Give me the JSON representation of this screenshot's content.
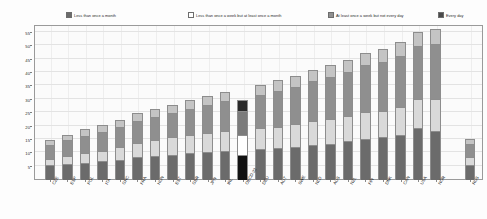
{
  "chart_data": {
    "type": "bar",
    "subtype": "stacked-vertical",
    "title": "",
    "xlabel": "",
    "ylabel": "",
    "ylim": [
      0,
      58
    ],
    "y_ticks": [
      5,
      10,
      15,
      20,
      25,
      30,
      35,
      40,
      45,
      50,
      55
    ],
    "grid": true,
    "legend_position": "top",
    "stack_order_bottom_to_top": [
      "Every day",
      "At least once a week but not every day",
      "Less than once a week but at least once a month",
      "Less than once a month"
    ],
    "categories": [
      "CZE",
      "ESP",
      "POL",
      "ITA",
      "GRC",
      "FRA",
      "HUN",
      "EST",
      "GBR",
      "JPN",
      "IRL",
      "OECD-22",
      "DEU",
      "AUT",
      "SWE",
      "NLD",
      "AUS",
      "NZL",
      "FIN",
      "DNK",
      "CAN",
      "USA",
      "NOR",
      "RUS"
    ],
    "highlight_category": "OECD-22",
    "separated_category": "RUS",
    "series": [
      {
        "name": "Less than once a month",
        "color": "#c4c4c4",
        "values": [
          2.0,
          2.0,
          2.5,
          2.5,
          2.5,
          3.0,
          3.0,
          3.0,
          3.5,
          3.5,
          3.5,
          4.0,
          3.5,
          4.0,
          4.0,
          4.0,
          4.5,
          4.5,
          4.5,
          5.0,
          5.0,
          5.5,
          5.5,
          2.0
        ]
      },
      {
        "name": "At least once a week but not every day",
        "color": "#8f8f8f",
        "values": [
          5.0,
          6.0,
          6.5,
          7.0,
          7.5,
          8.0,
          8.5,
          9.0,
          9.5,
          10.5,
          11.0,
          9.0,
          12.5,
          13.5,
          14.0,
          15.0,
          15.5,
          16.5,
          17.5,
          18.0,
          19.0,
          19.5,
          20.5,
          5.0
        ]
      },
      {
        "name": "Less than once a week but at least once a month",
        "color": "#d9d9d9",
        "values": [
          2.5,
          3.0,
          3.5,
          4.0,
          5.0,
          5.5,
          6.0,
          6.5,
          7.0,
          7.0,
          7.5,
          7.5,
          8.0,
          8.0,
          8.5,
          9.0,
          9.5,
          9.5,
          10.0,
          10.0,
          10.5,
          11.0,
          12.0,
          3.0
        ]
      },
      {
        "name": "Every day",
        "color": "#6b6b6b",
        "values": [
          5.5,
          6.0,
          6.5,
          7.0,
          7.5,
          8.5,
          9.0,
          9.5,
          10.0,
          10.5,
          11.0,
          9.5,
          11.5,
          12.0,
          12.5,
          13.0,
          13.5,
          14.5,
          15.5,
          16.0,
          17.0,
          19.5,
          18.5,
          5.5
        ]
      }
    ],
    "totals": [
      15.0,
      17.0,
      19.0,
      20.5,
      22.5,
      25.0,
      26.5,
      28.0,
      30.0,
      31.5,
      33.0,
      30.0,
      35.5,
      37.5,
      39.0,
      41.0,
      43.0,
      45.0,
      47.5,
      49.0,
      51.5,
      55.5,
      56.5,
      15.5
    ]
  },
  "legend": {
    "items": [
      {
        "label": "Less than once a month",
        "swatch": "#6b6b6b"
      },
      {
        "label": "Less than once a week but at least once a month",
        "swatch": "#ffffff"
      },
      {
        "label": "At least once a week but not every day",
        "swatch": "#8f8f8f"
      },
      {
        "label": "Every day",
        "swatch": "#4a4a4a"
      }
    ]
  }
}
